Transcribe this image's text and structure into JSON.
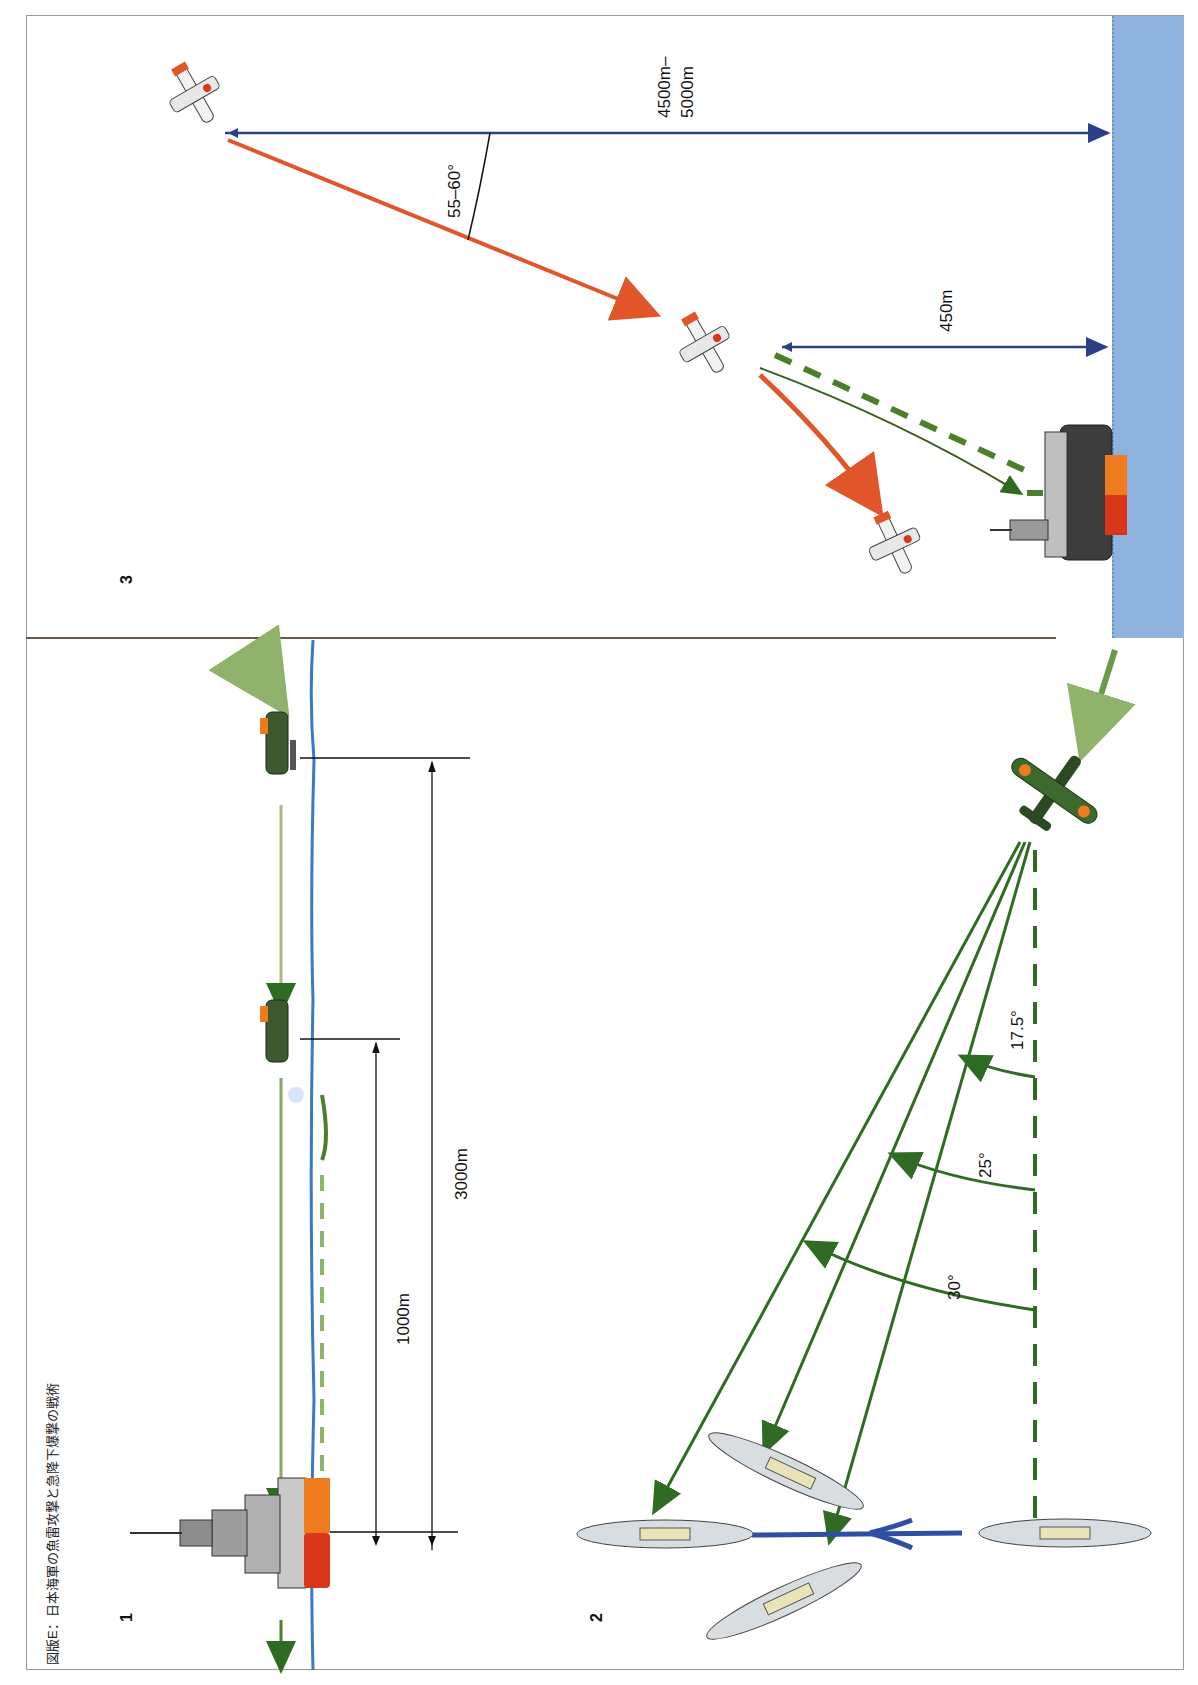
{
  "figure": {
    "caption": "図版E：日本海軍の魚雷攻撃と急降下爆撃の戦術",
    "orientation": "rotated -90deg",
    "colors": {
      "sea": "#8fb2de",
      "dive_path": "#e0552a",
      "torpedo_path": "#2f6b22",
      "torpedo_wake": "#4d7f2a",
      "ship_hull_red": "#d9361a",
      "ship_hull_orange": "#ef7b1f",
      "measure_line_blue": "#2b3f86",
      "waterline_blue": "#3a78c9",
      "ink": "#111111"
    }
  },
  "panels": [
    {
      "id": "1",
      "label": "1",
      "title": "torpedo attack (side view)",
      "distances": [
        {
          "label": "1000m"
        },
        {
          "label": "3000m"
        }
      ]
    },
    {
      "id": "2",
      "label": "2",
      "title": "torpedo spread angles (plan view)",
      "angles": [
        {
          "label": "17.5°"
        },
        {
          "label": "25°"
        },
        {
          "label": "30°"
        }
      ]
    },
    {
      "id": "3",
      "label": "3",
      "title": "dive bombing",
      "altitude_start": "4500m–",
      "altitude_start_2": "5000m",
      "dive_angle": "55–60°",
      "release_altitude": "450m"
    }
  ]
}
